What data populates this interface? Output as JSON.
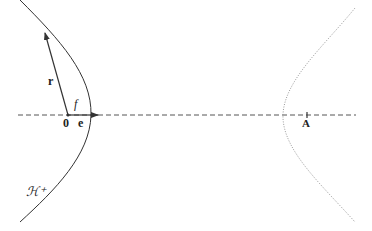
{
  "diagram": {
    "labels": {
      "position_vector": "r",
      "origin": "0",
      "unit_vector": "e",
      "angle": "f",
      "branch": "ℋ⁺",
      "point_A": "A"
    },
    "elements": {
      "hyperbola_branch_solid": "H+ branch (solid)",
      "hyperbola_branch_dotted": "opposite branch (dotted)",
      "axis": "dashed horizontal axis",
      "vector_r": "arrow from origin to curve",
      "vector_e": "arrow from origin along axis"
    },
    "colors": {
      "stroke": "#333333",
      "dotted": "#999999",
      "background": "#ffffff"
    }
  }
}
